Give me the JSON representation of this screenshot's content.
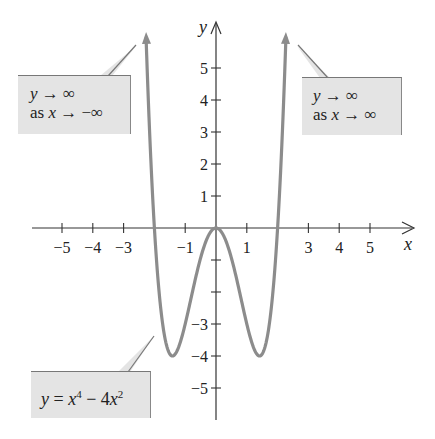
{
  "chart_data": {
    "type": "line",
    "title": "",
    "equation": "y = x^4 - 4x^2",
    "xlabel": "x",
    "ylabel": "y",
    "xlim": [
      -5.5,
      6.2
    ],
    "ylim": [
      -6,
      6.5
    ],
    "grid": false,
    "x_ticks": [
      -5,
      -4,
      -3,
      -2,
      -1,
      0,
      1,
      2,
      3,
      4,
      5
    ],
    "x_tick_labels": [
      "-5",
      "-4",
      "-3",
      "",
      "-1",
      "",
      "1",
      "",
      "3",
      "4",
      "5"
    ],
    "y_ticks": [
      -5,
      -4,
      -3,
      -2,
      -1,
      1,
      2,
      3,
      4,
      5
    ],
    "y_tick_labels": [
      "-5",
      "-4",
      "-3",
      "",
      "",
      "1",
      "2",
      "3",
      "4",
      "5"
    ],
    "series": [
      {
        "name": "y = x^4 - 4x^2",
        "color": "#8c8c8c",
        "x": [
          -2.27,
          -2.0,
          -1.8,
          -1.6,
          -1.414,
          -1.2,
          -1.0,
          -0.8,
          -0.6,
          -0.4,
          -0.2,
          0.0,
          0.2,
          0.4,
          0.6,
          0.8,
          1.0,
          1.2,
          1.414,
          1.6,
          1.8,
          2.0,
          2.27
        ],
        "y": [
          6.0,
          0.0,
          -2.46,
          -3.69,
          -4.0,
          -3.69,
          -3.0,
          -2.15,
          -1.31,
          -0.61,
          -0.16,
          0.0,
          -0.16,
          -0.61,
          -1.31,
          -2.15,
          -3.0,
          -3.69,
          -4.0,
          -3.69,
          -2.46,
          0.0,
          6.0
        ],
        "end_arrows": true
      }
    ],
    "key_points": {
      "x_intercepts": [
        -2,
        0,
        2
      ],
      "local_max": [
        0,
        0
      ],
      "local_minima": [
        [
          -1.414,
          -4
        ],
        [
          1.414,
          -4
        ]
      ]
    },
    "annotations": [
      {
        "id": "left",
        "lines": [
          "y → ∞",
          "as x → −∞"
        ]
      },
      {
        "id": "right",
        "lines": [
          "y → ∞",
          "as x → ∞"
        ]
      },
      {
        "id": "equation",
        "lines": [
          "y = x⁴ − 4x²"
        ]
      }
    ]
  },
  "callouts": {
    "left": {
      "line1_var": "y",
      "line1_rest": " → ∞",
      "line2_prefix": "as ",
      "line2_var": "x",
      "line2_rest": " → −∞"
    },
    "right": {
      "line1_var": "y",
      "line1_rest": " → ∞",
      "line2_prefix": "as ",
      "line2_var": "x",
      "line2_rest": " → ∞"
    },
    "equation": {
      "y": "y",
      "eq": " = ",
      "x1": "x",
      "exp1": "4",
      "minus": " − 4",
      "x2": "x",
      "exp2": "2"
    }
  },
  "axes": {
    "x_name": "x",
    "y_name": "y"
  },
  "colors": {
    "curve": "#8c8c8c",
    "axis": "#333333",
    "callout_fill": "#e4e4e4",
    "callout_border": "#808080"
  }
}
